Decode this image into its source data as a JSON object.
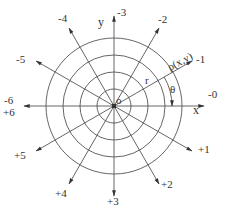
{
  "diagram": {
    "type": "polar-coordinate-grid",
    "center": {
      "x": 114,
      "y": 106
    },
    "colors": {
      "line": "#555555",
      "text": "#333333",
      "background": "#ffffff"
    },
    "rings": [
      17,
      34,
      51,
      68
    ],
    "ray_length": 90,
    "rays": [
      {
        "angle_deg": 0,
        "label": "-0",
        "lx": 208,
        "ly": 98
      },
      {
        "angle_deg": 30,
        "label": "-1",
        "lx": 196,
        "ly": 63
      },
      {
        "angle_deg": 60,
        "label": "-2",
        "lx": 158,
        "ly": 23
      },
      {
        "angle_deg": 90,
        "label": "-3",
        "lx": 117,
        "ly": 16
      },
      {
        "angle_deg": 120,
        "label": "-4",
        "lx": 58,
        "ly": 22
      },
      {
        "angle_deg": 150,
        "label": "-5",
        "lx": 16,
        "ly": 63
      },
      {
        "angle_deg": 180,
        "label": "-6",
        "lx": 4,
        "ly": 104
      },
      {
        "angle_deg": 210,
        "label": "+5",
        "lx": 14,
        "ly": 159
      },
      {
        "angle_deg": 240,
        "label": "+4",
        "lx": 55,
        "ly": 197
      },
      {
        "angle_deg": 270,
        "label": "+3",
        "lx": 107,
        "ly": 205
      },
      {
        "angle_deg": 300,
        "label": "+2",
        "lx": 161,
        "ly": 188
      },
      {
        "angle_deg": 330,
        "label": "+1",
        "lx": 198,
        "ly": 153
      }
    ],
    "extra_labels": {
      "plus_six": {
        "text": "+6",
        "x": 3,
        "y": 116
      },
      "x_axis": {
        "text": "x",
        "x": 193,
        "y": 114
      },
      "y_axis": {
        "text": "y",
        "x": 98,
        "y": 26
      },
      "origin": {
        "text": "o",
        "x": 116,
        "y": 104
      },
      "radius": {
        "text": "r",
        "x": 145,
        "y": 84
      },
      "theta": {
        "text": "θ",
        "x": 170,
        "y": 93
      },
      "point": {
        "text": "ρ(x,y)",
        "x": 170,
        "y": 71
      }
    },
    "theta_arc_radius": 58
  }
}
